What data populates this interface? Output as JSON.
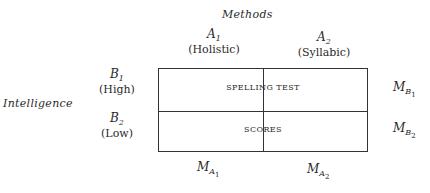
{
  "factors": {
    "column_factor": {
      "title": "Methods",
      "levels": [
        {
          "symbol": "A",
          "sub": "1",
          "label": "(Holistic)"
        },
        {
          "symbol": "A",
          "sub": "2",
          "label": "(Syllabic)"
        }
      ]
    },
    "row_factor": {
      "title": "Intelligence",
      "levels": [
        {
          "symbol": "B",
          "sub": "1",
          "label": "(High)"
        },
        {
          "symbol": "B",
          "sub": "2",
          "label": "(Low)"
        }
      ]
    }
  },
  "cell_text": {
    "line1": "SPELLING TEST",
    "line2": "SCORES"
  },
  "marginal_means": {
    "rows": [
      {
        "symbol": "M",
        "sub": "B",
        "subsub": "1"
      },
      {
        "symbol": "M",
        "sub": "B",
        "subsub": "2"
      }
    ],
    "columns": [
      {
        "symbol": "M",
        "sub": "A",
        "subsub": "1"
      },
      {
        "symbol": "M",
        "sub": "A",
        "subsub": "2"
      }
    ]
  }
}
